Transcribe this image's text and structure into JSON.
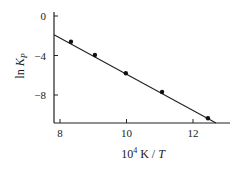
{
  "chart_data": {
    "type": "scatter",
    "title": "",
    "xlabel": "10^4 K / T",
    "xlabel_parts": {
      "base": "10",
      "sup": "4",
      "rest": " K / ",
      "italic": "T"
    },
    "ylabel": "ln K_p",
    "ylabel_parts": {
      "fn": "ln ",
      "var": "K",
      "sub": "P"
    },
    "xlim": [
      7.82,
      13.1
    ],
    "ylim": [
      -10.8,
      0.4
    ],
    "xticks": [
      8,
      10,
      12
    ],
    "yticks": [
      0,
      -4,
      -8
    ],
    "xtick_labels": [
      "8",
      "10",
      "12"
    ],
    "ytick_labels": [
      "0",
      "−4",
      "−8"
    ],
    "grid": false,
    "legend": null,
    "series": [
      {
        "name": "data",
        "marker": "circle",
        "x": [
          8.33,
          9.05,
          9.98,
          11.07,
          12.45
        ],
        "y": [
          -2.6,
          -3.95,
          -5.8,
          -7.7,
          -10.35
        ]
      },
      {
        "name": "fit",
        "style": "line",
        "x": [
          7.82,
          12.7
        ],
        "y": [
          -1.9,
          -10.8
        ]
      }
    ]
  }
}
